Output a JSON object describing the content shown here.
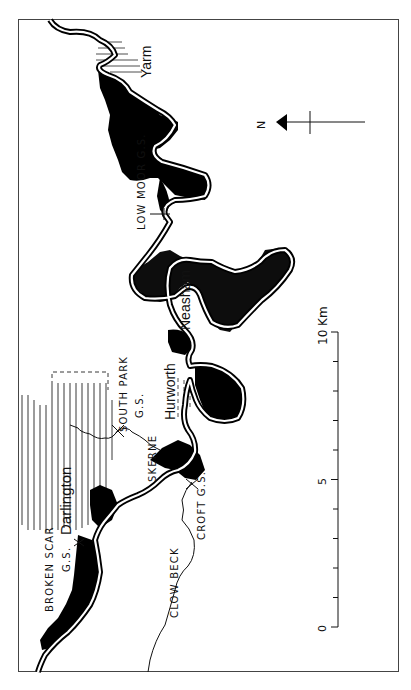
{
  "map": {
    "orientation": "rotated 90 degrees counter-clockwise (north points left)",
    "towns": [
      {
        "name": "Yarm"
      },
      {
        "name": "Neasham"
      },
      {
        "name": "Hurworth"
      },
      {
        "name": "Darlington"
      }
    ],
    "gauging_stations": [
      {
        "name": "LOW MOOR G.S."
      },
      {
        "name": "SOUTH PARK",
        "suffix": "G.S."
      },
      {
        "name": "CROFT G.S."
      },
      {
        "name": "BROKEN SCAR",
        "suffix": "G.S."
      }
    ],
    "tributaries": [
      {
        "name": "SKERNE"
      },
      {
        "name": "CLOW BECK"
      }
    ],
    "north_arrow": {
      "label": "N"
    },
    "scale_bar": {
      "unit": "Km",
      "ticks": [
        "0",
        "5",
        "10"
      ],
      "label_10": "10 Km",
      "minor_tick_interval_km": 1
    },
    "colors": {
      "ink": "#111111",
      "background": "#ffffff",
      "floodplain_fill": "#000000"
    }
  }
}
